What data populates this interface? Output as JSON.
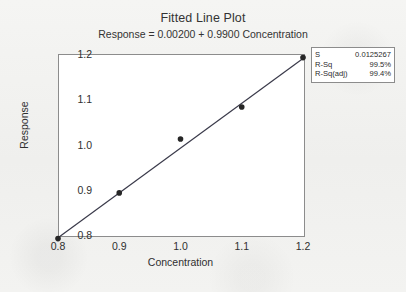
{
  "chart_data": {
    "type": "scatter",
    "title": "Fitted Line Plot",
    "subtitle": "Response = 0.00200 + 0.9900 Concentration",
    "xlabel": "Concentration",
    "ylabel": "Response",
    "xlim": [
      0.8,
      1.2
    ],
    "ylim": [
      0.8,
      1.2
    ],
    "xticks": [
      "0.8",
      "0.9",
      "1.0",
      "1.1",
      "1.2"
    ],
    "yticks": [
      "0.8",
      "0.9",
      "1.0",
      "1.1",
      "1.2"
    ],
    "xtick_values": [
      0.8,
      0.9,
      1.0,
      1.1,
      1.2
    ],
    "ytick_values": [
      0.8,
      0.9,
      1.0,
      1.1,
      1.2
    ],
    "grid": false,
    "legend": "none",
    "x": [
      0.8,
      0.9,
      1.0,
      1.1,
      1.2
    ],
    "y": [
      0.792,
      0.893,
      1.012,
      1.083,
      1.192
    ],
    "points": [
      {
        "x": 0.8,
        "y": 0.792
      },
      {
        "x": 0.9,
        "y": 0.893
      },
      {
        "x": 1.0,
        "y": 1.012
      },
      {
        "x": 1.1,
        "y": 1.083
      },
      {
        "x": 1.2,
        "y": 1.192
      }
    ],
    "fit_line": {
      "intercept": 0.002,
      "slope": 0.99,
      "equation": "Response = 0.00200 + 0.9900 Concentration",
      "x_start": 0.8,
      "x_end": 1.2,
      "y_start": 0.794,
      "y_end": 1.19
    },
    "marker_color": "#262626",
    "line_color": "#3a3a4a",
    "plot_bg": "#ffffff",
    "frame_color": "#8c8c8c"
  },
  "stats": {
    "title": "regression-statistics",
    "rows": [
      {
        "key": "S",
        "value": "0.0125267"
      },
      {
        "key": "R-Sq",
        "value": "99.5%"
      },
      {
        "key": "R-Sq(adj)",
        "value": "99.4%"
      }
    ]
  }
}
